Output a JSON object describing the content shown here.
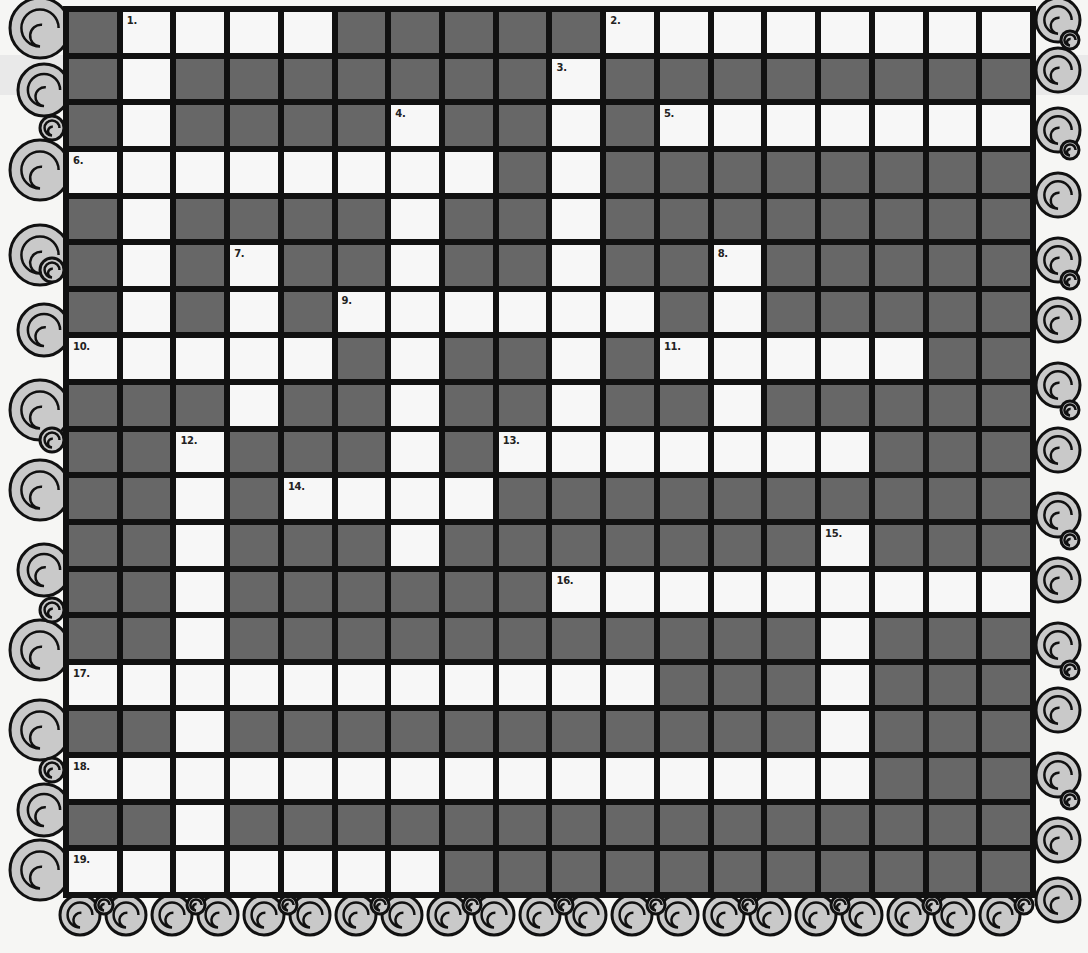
{
  "puzzle": {
    "type": "crossword",
    "columns": 18,
    "rows": 19,
    "legend": {
      "#": "blocked-cell",
      ".": "answer-cell"
    },
    "grid": [
      "#....#####........",
      "#.#######.########",
      "#.####.##.#.......",
      "........#.########",
      "#.####.##.########",
      "#.#.##.##.##.#####",
      "#.#.#......#.#####",
      ".....#.##.#.....##",
      "###.##.##.##.#####",
      "##.###.#.......###",
      "##.#....##########",
      "##.###.#######.###",
      "##.######.........",
      "##.###########.###",
      "...........###.###",
      "##.###########.###",
      "...............###",
      "##.###############",
      ".......###########"
    ],
    "clue_numbers": [
      {
        "label": "1.",
        "row": 0,
        "col": 1
      },
      {
        "label": "2.",
        "row": 0,
        "col": 10
      },
      {
        "label": "3.",
        "row": 1,
        "col": 9
      },
      {
        "label": "4.",
        "row": 2,
        "col": 6
      },
      {
        "label": "5.",
        "row": 2,
        "col": 11
      },
      {
        "label": "6.",
        "row": 3,
        "col": 0
      },
      {
        "label": "7.",
        "row": 5,
        "col": 3
      },
      {
        "label": "8.",
        "row": 5,
        "col": 12
      },
      {
        "label": "9.",
        "row": 6,
        "col": 5
      },
      {
        "label": "10.",
        "row": 7,
        "col": 0
      },
      {
        "label": "11.",
        "row": 7,
        "col": 11
      },
      {
        "label": "12.",
        "row": 9,
        "col": 2
      },
      {
        "label": "13.",
        "row": 9,
        "col": 8
      },
      {
        "label": "14.",
        "row": 10,
        "col": 4
      },
      {
        "label": "15.",
        "row": 11,
        "col": 14
      },
      {
        "label": "16.",
        "row": 12,
        "col": 9
      },
      {
        "label": "17.",
        "row": 14,
        "col": 0
      },
      {
        "label": "18.",
        "row": 16,
        "col": 0
      },
      {
        "label": "19.",
        "row": 18,
        "col": 0
      }
    ],
    "colors": {
      "block": "#676767",
      "open": "#f7f7f7",
      "gridline": "#111111",
      "scroll_fill": "#c9c9c9",
      "scroll_stroke": "#111111",
      "background": "#f6f6f4"
    }
  },
  "decorations": {
    "border_style": "scroll-spiral-border",
    "sides": [
      "left",
      "right",
      "bottom"
    ]
  }
}
